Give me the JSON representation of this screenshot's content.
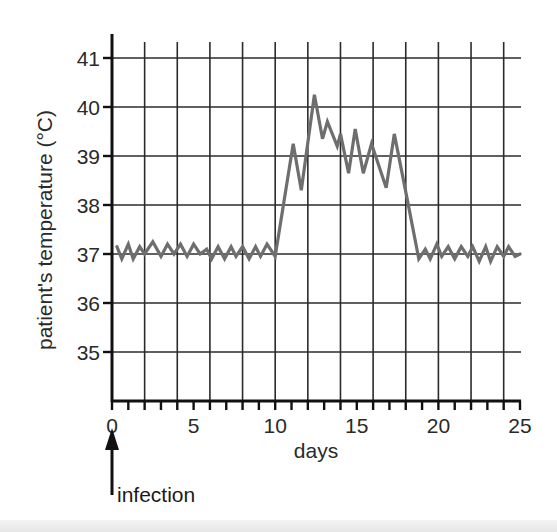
{
  "chart_data": {
    "type": "line",
    "title": "",
    "xlabel": "days",
    "ylabel": "patient's temperature (°C)",
    "xlim": [
      0,
      25
    ],
    "ylim": [
      34,
      41.5
    ],
    "x_ticks": [
      0,
      5,
      10,
      15,
      20,
      25
    ],
    "x_tick_labels": [
      "0",
      "5",
      "10",
      "15",
      "20",
      "25"
    ],
    "x_minor_tick_step": 1,
    "x_grid_step": 2,
    "y_ticks": [
      35,
      36,
      37,
      38,
      39,
      40,
      41
    ],
    "y_tick_labels": [
      "35",
      "36",
      "37",
      "38",
      "39",
      "40",
      "41"
    ],
    "grid": true,
    "legend": null,
    "annotations": [
      {
        "text": "infection",
        "type": "arrow",
        "x": 0,
        "points_to": "x-axis at day 0"
      }
    ],
    "series": [
      {
        "name": "patient temperature",
        "color": "#6e6e6e",
        "x": [
          0.3,
          0.6,
          1.0,
          1.3,
          1.7,
          2.0,
          2.5,
          3.0,
          3.4,
          3.8,
          4.2,
          4.6,
          5.0,
          5.4,
          5.8,
          6.1,
          6.5,
          6.9,
          7.3,
          7.6,
          8.0,
          8.4,
          8.8,
          9.1,
          9.5,
          10.0,
          11.1,
          11.6,
          12.4,
          12.9,
          13.2,
          13.8,
          14.0,
          14.5,
          14.9,
          15.4,
          15.9,
          16.8,
          17.3,
          18.1,
          18.8,
          19.2,
          19.5,
          19.9,
          20.2,
          20.6,
          21.0,
          21.4,
          21.8,
          22.1,
          22.5,
          22.9,
          23.2,
          23.6,
          24.0,
          24.3,
          24.7,
          25.0
        ],
        "y": [
          37.15,
          36.9,
          37.2,
          36.9,
          37.15,
          37.0,
          37.25,
          36.95,
          37.2,
          37.0,
          37.2,
          36.95,
          37.2,
          37.0,
          37.1,
          36.9,
          37.15,
          36.9,
          37.15,
          36.95,
          37.15,
          36.9,
          37.15,
          36.95,
          37.2,
          36.95,
          39.25,
          38.3,
          40.25,
          39.35,
          39.7,
          39.2,
          39.45,
          38.65,
          39.55,
          38.65,
          39.25,
          38.35,
          39.45,
          38.1,
          36.9,
          37.1,
          36.9,
          37.2,
          36.95,
          37.15,
          36.9,
          37.15,
          36.95,
          37.15,
          36.85,
          37.15,
          36.85,
          37.15,
          36.95,
          37.15,
          36.95,
          37.0
        ]
      }
    ]
  }
}
